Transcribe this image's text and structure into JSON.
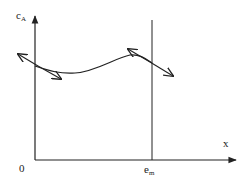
{
  "diagram": {
    "axes": {
      "y_label": "c",
      "y_label_subscript": "A",
      "x_label": "x",
      "origin_label": "0",
      "marker_label": "e",
      "marker_label_subscript": "m"
    },
    "elements": [
      "y-axis arrow",
      "x-axis arrow",
      "vertical line at e_m",
      "curve of c_A vs x",
      "tangent double-arrow at x=0",
      "tangent double-arrow at x=e_m"
    ],
    "colors": {
      "line": "#222222",
      "background": "#ffffff"
    }
  }
}
